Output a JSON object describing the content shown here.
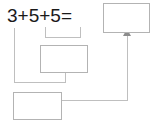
{
  "diagram": {
    "type": "arithmetic-worksheet",
    "equation": {
      "text": "3+5+5=",
      "operands": [
        "3",
        "5",
        "5"
      ],
      "operators": [
        "+",
        "+"
      ],
      "relation": "="
    },
    "boxes": [
      {
        "name": "answer-box",
        "value": "",
        "role": "final-answer"
      },
      {
        "name": "middle-box",
        "value": "",
        "role": "partial-sum-5-plus-5"
      },
      {
        "name": "lower-box",
        "value": "",
        "role": "partial-sum-3-plus-result"
      }
    ],
    "arrow": {
      "name": "result-arrow",
      "direction": "up",
      "points_to": "answer-box"
    },
    "colors": {
      "text": "#1a1a1a",
      "box_border": "#b3b3b3",
      "box_fill": "#ffffff",
      "connector": "#bfbfbf",
      "arrow": "#8c8c8c",
      "background": "#ffffff"
    }
  }
}
